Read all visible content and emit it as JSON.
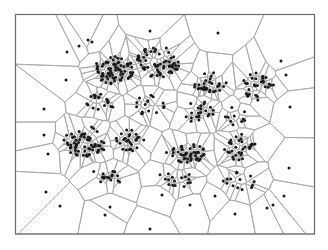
{
  "diagram": {
    "type": "voronoi",
    "frame": {
      "x0": 15.5,
      "y0": 14.5,
      "x1": 314.5,
      "y1": 234
    },
    "colors": {
      "background": "#ffffff",
      "edge": "#a9a9a9",
      "frame": "#6b6b6b",
      "site": "#1a1a1a"
    },
    "site_radius": 1.5,
    "sparse_sites": [
      [
        67,
        52
      ],
      [
        79,
        46
      ],
      [
        88,
        40
      ],
      [
        92,
        42
      ],
      [
        150,
        31
      ],
      [
        66,
        80
      ],
      [
        44,
        109
      ],
      [
        44,
        135
      ],
      [
        48,
        154
      ],
      [
        46,
        192
      ],
      [
        60,
        206
      ],
      [
        105,
        215
      ],
      [
        150,
        229
      ],
      [
        218,
        33
      ],
      [
        281,
        61
      ],
      [
        286,
        75
      ],
      [
        290,
        107
      ],
      [
        289,
        168
      ],
      [
        284,
        196
      ],
      [
        273,
        205
      ],
      [
        267,
        208
      ],
      [
        110,
        207
      ],
      [
        162,
        195
      ],
      [
        190,
        205
      ],
      [
        215,
        196
      ],
      [
        235,
        214
      ]
    ],
    "clusters": [
      {
        "cx": 115,
        "cy": 70,
        "rx": 22,
        "ry": 14,
        "n": 70,
        "seed": 11
      },
      {
        "cx": 158,
        "cy": 62,
        "rx": 22,
        "ry": 16,
        "n": 60,
        "seed": 23
      },
      {
        "cx": 210,
        "cy": 82,
        "rx": 18,
        "ry": 10,
        "n": 30,
        "seed": 37
      },
      {
        "cx": 258,
        "cy": 86,
        "rx": 16,
        "ry": 14,
        "n": 30,
        "seed": 41
      },
      {
        "cx": 85,
        "cy": 142,
        "rx": 22,
        "ry": 16,
        "n": 60,
        "seed": 53
      },
      {
        "cx": 130,
        "cy": 140,
        "rx": 14,
        "ry": 12,
        "n": 26,
        "seed": 59
      },
      {
        "cx": 185,
        "cy": 153,
        "rx": 22,
        "ry": 10,
        "n": 45,
        "seed": 67
      },
      {
        "cx": 240,
        "cy": 148,
        "rx": 16,
        "ry": 14,
        "n": 30,
        "seed": 71
      },
      {
        "cx": 200,
        "cy": 112,
        "rx": 16,
        "ry": 12,
        "n": 22,
        "seed": 79
      },
      {
        "cx": 100,
        "cy": 102,
        "rx": 18,
        "ry": 8,
        "n": 18,
        "seed": 83
      },
      {
        "cx": 150,
        "cy": 105,
        "rx": 18,
        "ry": 10,
        "n": 16,
        "seed": 89
      },
      {
        "cx": 110,
        "cy": 175,
        "rx": 20,
        "ry": 10,
        "n": 16,
        "seed": 97
      },
      {
        "cx": 175,
        "cy": 180,
        "rx": 22,
        "ry": 8,
        "n": 16,
        "seed": 101
      },
      {
        "cx": 240,
        "cy": 180,
        "rx": 18,
        "ry": 10,
        "n": 14,
        "seed": 103
      },
      {
        "cx": 235,
        "cy": 115,
        "rx": 12,
        "ry": 10,
        "n": 10,
        "seed": 107
      }
    ]
  }
}
